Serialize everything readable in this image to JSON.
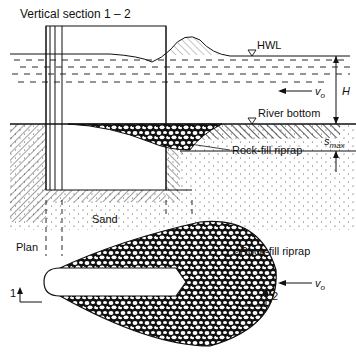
{
  "diagram": {
    "section_title": "Vertical section  1 – 2",
    "plan_title": "Plan",
    "labels": {
      "hwl": "HWL",
      "velocity": "v",
      "velocity_sub": "o",
      "depth": "H",
      "river_bottom": "River bottom",
      "scour_depth": "s",
      "scour_depth_sub": "max",
      "riprap_section": "Rock-fill riprap",
      "sand": "Sand",
      "riprap_plan": "Rock-fill riprap",
      "section_mark_1": "1",
      "section_mark_2": "2",
      "plan_velocity": "v",
      "plan_velocity_sub": "o"
    },
    "colors": {
      "ink": "#111111",
      "paper": "#ffffff"
    }
  }
}
